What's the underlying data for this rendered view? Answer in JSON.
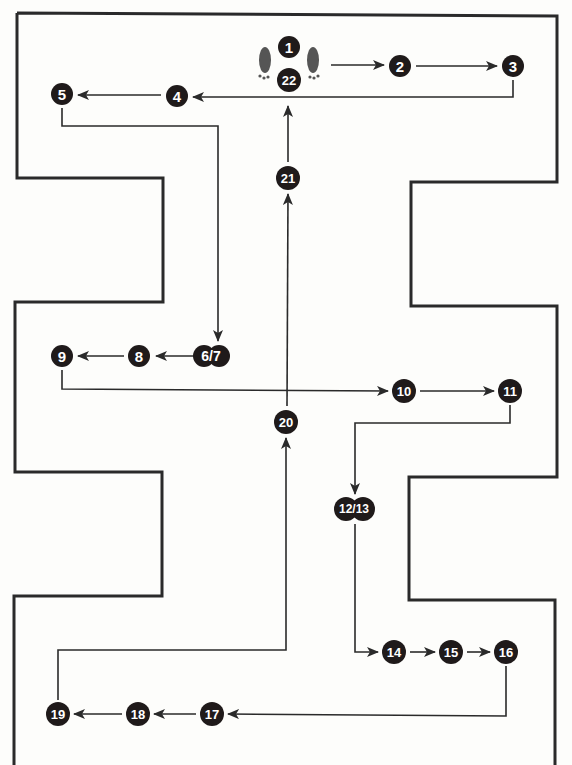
{
  "diagram": {
    "type": "floor-path-diagram",
    "colors": {
      "wall": "#2a2a2a",
      "node_fill": "#1f1a1a",
      "node_text": "#ffffff",
      "background": "#fdfdfb"
    },
    "start_icon": "footprints-icon",
    "nodes": [
      {
        "id": "n1",
        "label": "1",
        "x": 289,
        "y": 47
      },
      {
        "id": "n22",
        "label": "22",
        "x": 289,
        "y": 80
      },
      {
        "id": "n2",
        "label": "2",
        "x": 400,
        "y": 66
      },
      {
        "id": "n3",
        "label": "3",
        "x": 513,
        "y": 66
      },
      {
        "id": "n4",
        "label": "4",
        "x": 175,
        "y": 96
      },
      {
        "id": "n5",
        "label": "5",
        "x": 62,
        "y": 94
      },
      {
        "id": "n6_7",
        "label": "6/7",
        "x": 211,
        "y": 356
      },
      {
        "id": "n8",
        "label": "8",
        "x": 139,
        "y": 356
      },
      {
        "id": "n9",
        "label": "9",
        "x": 62,
        "y": 356
      },
      {
        "id": "n10",
        "label": "10",
        "x": 404,
        "y": 391
      },
      {
        "id": "n11",
        "label": "11",
        "x": 510,
        "y": 391
      },
      {
        "id": "n12_13",
        "label": "12/13",
        "x": 354,
        "y": 509
      },
      {
        "id": "n14",
        "label": "14",
        "x": 394,
        "y": 652
      },
      {
        "id": "n15",
        "label": "15",
        "x": 451,
        "y": 652
      },
      {
        "id": "n16",
        "label": "16",
        "x": 506,
        "y": 652
      },
      {
        "id": "n17",
        "label": "17",
        "x": 212,
        "y": 714
      },
      {
        "id": "n18",
        "label": "18",
        "x": 138,
        "y": 714
      },
      {
        "id": "n19",
        "label": "19",
        "x": 58,
        "y": 714
      },
      {
        "id": "n20",
        "label": "20",
        "x": 286,
        "y": 422
      },
      {
        "id": "n21",
        "label": "21",
        "x": 288,
        "y": 178
      }
    ],
    "sequence": [
      "1",
      "2",
      "3",
      "4",
      "5",
      "6/7",
      "8",
      "9",
      "10",
      "11",
      "12/13",
      "14",
      "15",
      "16",
      "17",
      "18",
      "19",
      "20",
      "21",
      "22"
    ]
  }
}
